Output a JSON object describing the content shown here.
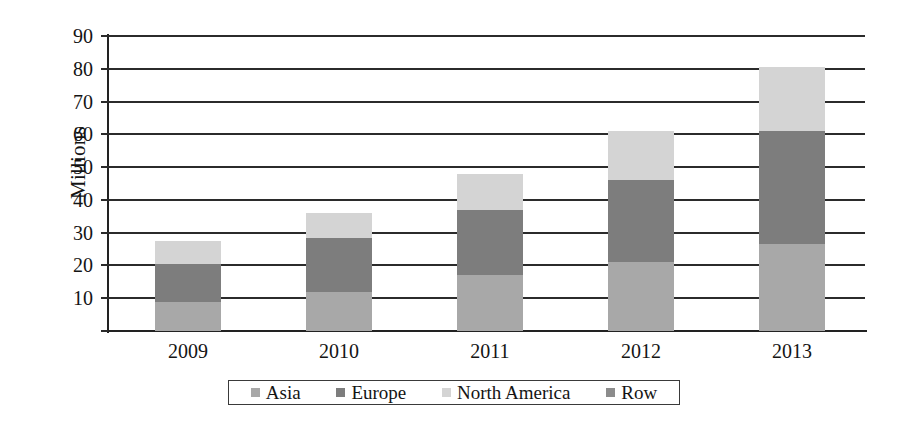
{
  "chart_data": {
    "type": "bar",
    "subtype": "stacked-bar",
    "title": "",
    "xlabel": "",
    "ylabel": "Millions",
    "categories": [
      "2009",
      "2010",
      "2011",
      "2012",
      "2013"
    ],
    "ylim": [
      0,
      90
    ],
    "yticks": [
      10,
      20,
      30,
      40,
      50,
      60,
      70,
      80,
      90
    ],
    "grid": true,
    "legend_position": "bottom",
    "series": [
      {
        "name": "Asia",
        "color": "#a8a8a8",
        "values": [
          9,
          12,
          17,
          21,
          26.5
        ]
      },
      {
        "name": "Europe",
        "color": "#7d7d7d",
        "values": [
          11.5,
          16.5,
          20,
          25,
          34.5
        ]
      },
      {
        "name": "North America",
        "color": "#d4d4d4",
        "values": [
          7,
          7.5,
          11,
          15,
          19.5
        ]
      },
      {
        "name": "Row",
        "color": "#8c8c8c",
        "values": [
          0,
          0,
          0,
          0,
          0
        ]
      }
    ],
    "totals": [
      27.5,
      36,
      48,
      61,
      80.5
    ]
  },
  "axes": {
    "y_tick_labels": [
      "90",
      "80",
      "70",
      "60",
      "50",
      "40",
      "30",
      "20",
      "10"
    ],
    "x_tick_labels": [
      "2009",
      "2010",
      "2011",
      "2012",
      "2013"
    ],
    "y_axis_title": "Millions"
  },
  "legend": {
    "items": [
      {
        "label": "Asia",
        "color": "#a8a8a8"
      },
      {
        "label": "Europe",
        "color": "#7d7d7d"
      },
      {
        "label": "North America",
        "color": "#d4d4d4"
      },
      {
        "label": "Row",
        "color": "#8c8c8c"
      }
    ]
  },
  "colors": {
    "asia": "#a8a8a8",
    "europe": "#7d7d7d",
    "north_america": "#d4d4d4",
    "row": "#8c8c8c",
    "axis": "#2b2b2b",
    "text": "#141414",
    "background": "#ffffff"
  }
}
